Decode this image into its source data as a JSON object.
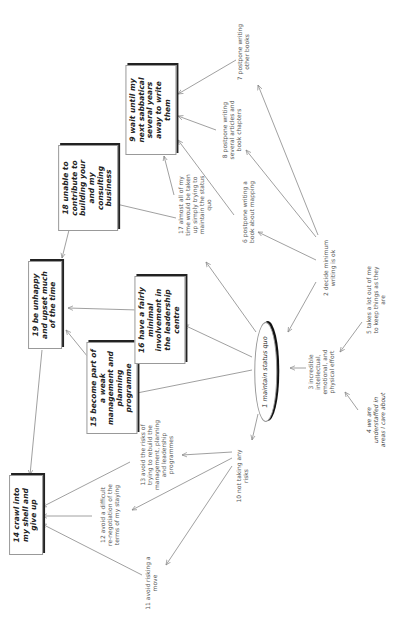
{
  "diagram": {
    "orientation": "rotated -90deg (text reads bottom-to-top)",
    "nodes": [
      {
        "id": 1,
        "label": "1 maintain status quo",
        "style": "ellipse",
        "x": 266,
        "y": 372,
        "w": 78
      },
      {
        "id": 2,
        "label": "2 decide minimum writing is ok",
        "style": "plain",
        "x": 330,
        "y": 268,
        "w": 62
      },
      {
        "id": 3,
        "label": "3 incredible intellectual, emotional, and physical effort",
        "style": "plain",
        "x": 322,
        "y": 372,
        "w": 56
      },
      {
        "id": 4,
        "label": "4 we are understaffed in areas I care about",
        "style": "italic",
        "x": 376,
        "y": 420,
        "w": 60
      },
      {
        "id": 5,
        "label": "5 takes a lot out of me to keep things as they are",
        "style": "plain",
        "x": 376,
        "y": 300,
        "w": 70
      },
      {
        "id": 6,
        "label": "6 postpone writing a book about mapping",
        "style": "plain",
        "x": 249,
        "y": 212,
        "w": 70
      },
      {
        "id": 7,
        "label": "7 postpone writing other books",
        "style": "plain",
        "x": 244,
        "y": 52,
        "w": 62
      },
      {
        "id": 8,
        "label": "8 postpone writing several articles and book chapters",
        "style": "plain",
        "x": 232,
        "y": 130,
        "w": 64
      },
      {
        "id": 9,
        "label": "9 wait until my next sabbatical several years away to write them",
        "style": "box",
        "x": 151,
        "y": 110,
        "w": 78
      },
      {
        "id": 10,
        "label": "10 not taking any risks",
        "style": "plain",
        "x": 243,
        "y": 476,
        "w": 56
      },
      {
        "id": 11,
        "label": "11 avoid risking a move",
        "style": "plain",
        "x": 152,
        "y": 583,
        "w": 56
      },
      {
        "id": 12,
        "label": "12 avoid a difficult re-negotiation of the terms of my staying",
        "style": "plain",
        "x": 110,
        "y": 515,
        "w": 62
      },
      {
        "id": 13,
        "label": "13 avoid the risks of trying to rebuild the management, planning and leadership programmes",
        "style": "plain",
        "x": 157,
        "y": 455,
        "w": 72
      },
      {
        "id": 14,
        "label": "14 crawl into my shell and give up",
        "style": "box",
        "x": 26,
        "y": 515,
        "w": 68
      },
      {
        "id": 15,
        "label": "15 become part of a weak management and planning programme",
        "style": "box",
        "x": 112,
        "y": 388,
        "w": 80
      },
      {
        "id": 16,
        "label": "16 have a fairly minimal involvement in the leadership centre",
        "style": "box",
        "x": 160,
        "y": 320,
        "w": 76
      },
      {
        "id": 17,
        "label": "17 almost all of my time would be taken up simply trying to maintain the status quo",
        "style": "plain",
        "x": 195,
        "y": 205,
        "w": 64
      },
      {
        "id": 18,
        "label": "18 unable to contribute to building your and my consulting business",
        "style": "box",
        "x": 88,
        "y": 188,
        "w": 74
      },
      {
        "id": 19,
        "label": "19 be unhappy and upset much of the time",
        "style": "box",
        "x": 45,
        "y": 305,
        "w": 76
      }
    ],
    "edges": [
      {
        "from": 2,
        "to": 7,
        "x1": 318,
        "y1": 235,
        "x2": 258,
        "y2": 85
      },
      {
        "from": 2,
        "to": 8,
        "x1": 316,
        "y1": 237,
        "x2": 246,
        "y2": 150
      },
      {
        "from": 2,
        "to": 6,
        "x1": 316,
        "y1": 260,
        "x2": 258,
        "y2": 232
      },
      {
        "from": 2,
        "to": 1,
        "x1": 316,
        "y1": 282,
        "x2": 288,
        "y2": 332
      },
      {
        "from": 6,
        "to": 9,
        "x1": 234,
        "y1": 215,
        "x2": 178,
        "y2": 140
      },
      {
        "from": 8,
        "to": 9,
        "x1": 216,
        "y1": 130,
        "x2": 178,
        "y2": 116
      },
      {
        "from": 7,
        "to": 9,
        "x1": 236,
        "y1": 60,
        "x2": 178,
        "y2": 94
      },
      {
        "from": 17,
        "to": 9,
        "x1": 174,
        "y1": 195,
        "x2": 164,
        "y2": 156
      },
      {
        "from": 17,
        "to": 18,
        "x1": 176,
        "y1": 218,
        "x2": 112,
        "y2": 203
      },
      {
        "from": 1,
        "to": 17,
        "x1": 256,
        "y1": 332,
        "x2": 206,
        "y2": 262
      },
      {
        "from": 1,
        "to": 16,
        "x1": 252,
        "y1": 357,
        "x2": 184,
        "y2": 325
      },
      {
        "from": 1,
        "to": 15,
        "x1": 252,
        "y1": 370,
        "x2": 132,
        "y2": 394
      },
      {
        "from": 1,
        "to": 10,
        "x1": 258,
        "y1": 414,
        "x2": 252,
        "y2": 440
      },
      {
        "from": 3,
        "to": 1,
        "x1": 306,
        "y1": 368,
        "x2": 290,
        "y2": 368
      },
      {
        "from": 5,
        "to": 3,
        "x1": 362,
        "y1": 322,
        "x2": 340,
        "y2": 352
      },
      {
        "from": 4,
        "to": 3,
        "x1": 358,
        "y1": 410,
        "x2": 345,
        "y2": 392
      },
      {
        "from": 16,
        "to": 19,
        "x1": 138,
        "y1": 310,
        "x2": 68,
        "y2": 308
      },
      {
        "from": 15,
        "to": 19,
        "x1": 92,
        "y1": 362,
        "x2": 66,
        "y2": 330
      },
      {
        "from": 18,
        "to": 19,
        "x1": 70,
        "y1": 226,
        "x2": 62,
        "y2": 258
      },
      {
        "from": 19,
        "to": 14,
        "x1": 42,
        "y1": 350,
        "x2": 30,
        "y2": 475
      },
      {
        "from": 10,
        "to": 13,
        "x1": 232,
        "y1": 452,
        "x2": 182,
        "y2": 455
      },
      {
        "from": 10,
        "to": 12,
        "x1": 232,
        "y1": 458,
        "x2": 132,
        "y2": 510
      },
      {
        "from": 10,
        "to": 11,
        "x1": 232,
        "y1": 466,
        "x2": 166,
        "y2": 565
      },
      {
        "from": 13,
        "to": 14,
        "x1": 130,
        "y1": 462,
        "x2": 42,
        "y2": 507
      },
      {
        "from": 12,
        "to": 14,
        "x1": 92,
        "y1": 516,
        "x2": 42,
        "y2": 516
      },
      {
        "from": 11,
        "to": 14,
        "x1": 142,
        "y1": 575,
        "x2": 42,
        "y2": 524
      }
    ],
    "colors": {
      "edge": "#888888",
      "box_shadow": "#222222",
      "text": "#333333"
    }
  }
}
